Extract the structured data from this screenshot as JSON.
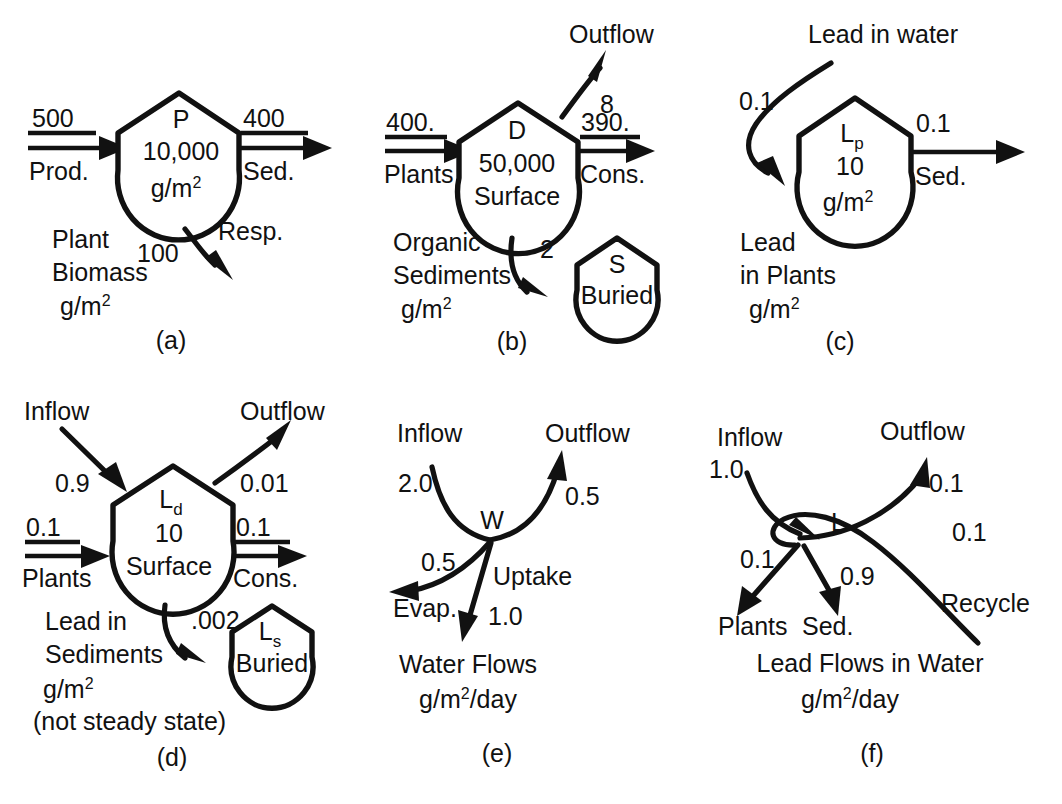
{
  "figure": {
    "units_area": "g/m",
    "units_exp": "2",
    "units_rate_suffix": "/day"
  },
  "panels": [
    {
      "id": "a",
      "label": "(a)",
      "node": {
        "symbol": "P",
        "value": "10,000",
        "units_base": "g/m",
        "units_exp": "2"
      },
      "caption_lines": [
        "Plant",
        "Biomass"
      ],
      "caption_units_base": "g/m",
      "caption_units_exp": "2",
      "flows": [
        {
          "name": "inflow",
          "value": "500",
          "label": "Prod.",
          "direction": "in-left"
        },
        {
          "name": "outflow",
          "value": "400",
          "label": "Sed.",
          "direction": "out-right"
        },
        {
          "name": "respiration",
          "value": "100",
          "label": "Resp.",
          "direction": "out-bottom"
        }
      ]
    },
    {
      "id": "b",
      "label": "(b)",
      "node": {
        "symbol": "D",
        "value": "50,000",
        "state": "Surface"
      },
      "node2": {
        "symbol": "S",
        "state": "Buried"
      },
      "caption_lines": [
        "Organic",
        "Sediments"
      ],
      "caption_units_base": "g/m",
      "caption_units_exp": "2",
      "flows": [
        {
          "name": "inflow",
          "value": "400.",
          "label": "Plants",
          "direction": "in-left"
        },
        {
          "name": "outflow",
          "value": "390.",
          "label": "Cons.",
          "direction": "out-right"
        },
        {
          "name": "outflow-top",
          "value": "8",
          "label": "Outflow",
          "direction": "out-upper-right"
        },
        {
          "name": "burial",
          "value": "2",
          "label": "",
          "direction": "out-bottom-right"
        }
      ]
    },
    {
      "id": "c",
      "label": "(c)",
      "node": {
        "symbol": "L",
        "symbol_sub": "p",
        "value": "10",
        "units_base": "g/m",
        "units_exp": "2"
      },
      "caption_lines": [
        "Lead",
        "in Plants"
      ],
      "caption_units_base": "g/m",
      "caption_units_exp": "2",
      "flows": [
        {
          "name": "inflow",
          "value": "0.1",
          "label": "Lead in water",
          "direction": "in-curved-left"
        },
        {
          "name": "outflow",
          "value": "0.1",
          "label": "Sed.",
          "direction": "out-right"
        }
      ]
    },
    {
      "id": "d",
      "label": "(d)",
      "node": {
        "symbol": "L",
        "symbol_sub": "d",
        "value": "10",
        "state": "Surface"
      },
      "node2": {
        "symbol": "L",
        "symbol_sub": "s",
        "state": "Buried"
      },
      "caption_lines": [
        "Lead in",
        "Sediments"
      ],
      "caption_units_base": "g/m",
      "caption_units_exp": "2",
      "caption_note": "(not steady state)",
      "flows": [
        {
          "name": "inflow-top",
          "value": "0.9",
          "label": "Inflow",
          "direction": "in-upper-left"
        },
        {
          "name": "outflow-top",
          "value": "0.01",
          "label": "Outflow",
          "direction": "out-upper-right"
        },
        {
          "name": "inflow",
          "value": "0.1",
          "label": "Plants",
          "direction": "in-left"
        },
        {
          "name": "outflow",
          "value": "0.1",
          "label": "Cons.",
          "direction": "out-right"
        },
        {
          "name": "burial",
          "value": ".002",
          "label": "",
          "direction": "out-bottom-right"
        }
      ]
    },
    {
      "id": "e",
      "label": "(e)",
      "node": {
        "symbol": "W"
      },
      "caption_lines": [
        "Water Flows"
      ],
      "caption_units_base": "g/m",
      "caption_units_exp": "2",
      "caption_units_suffix": "/day",
      "flows": [
        {
          "name": "inflow",
          "value": "2.0",
          "label": "Inflow",
          "direction": "in-upper-left"
        },
        {
          "name": "outflow",
          "value": "0.5",
          "label": "Outflow",
          "direction": "out-upper-right"
        },
        {
          "name": "evaporation",
          "value": "0.5",
          "label": "Evap.",
          "direction": "out-lower-left"
        },
        {
          "name": "uptake",
          "value": "1.0",
          "label": "Uptake",
          "direction": "out-bottom"
        }
      ]
    },
    {
      "id": "f",
      "label": "(f)",
      "node": {
        "symbol": "L"
      },
      "caption_lines": [
        "Lead Flows in Water"
      ],
      "caption_units_base": "g/m",
      "caption_units_exp": "2",
      "caption_units_suffix": "/day",
      "flows": [
        {
          "name": "inflow",
          "value": "1.0",
          "label": "Inflow",
          "direction": "in-upper-left"
        },
        {
          "name": "outflow",
          "value": "0.1",
          "label": "Outflow",
          "direction": "out-upper-right"
        },
        {
          "name": "plants",
          "value": "0.1",
          "label": "Plants",
          "direction": "out-lower-left"
        },
        {
          "name": "sediment",
          "value": "0.9",
          "label": "Sed.",
          "direction": "out-bottom"
        },
        {
          "name": "recycle",
          "value": "0.1",
          "label": "Recycle",
          "direction": "in-lower-right-loop"
        }
      ]
    }
  ],
  "colors": {
    "ink": "#111111",
    "background": "#ffffff"
  }
}
